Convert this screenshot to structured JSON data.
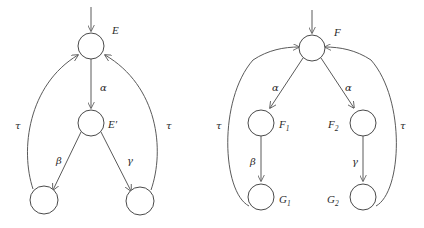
{
  "figure": {
    "background_color": "#ffffff",
    "stroke_color": "#5a5a5a",
    "text_color": "#2b2b2b"
  },
  "diagrams": [
    {
      "id": "left-diagram",
      "name": "E-diagram",
      "nodes": [
        {
          "id": "E",
          "label": "E",
          "label_suffix": "",
          "cx": 91,
          "cy": 46,
          "r": 13,
          "label_x": 112,
          "label_y": 34
        },
        {
          "id": "Eprime",
          "label": "E",
          "label_suffix": "′",
          "cx": 91,
          "cy": 123,
          "r": 13,
          "label_x": 110,
          "label_y": 128
        },
        {
          "id": "Lbot",
          "label": "",
          "label_suffix": "",
          "cx": 44,
          "cy": 200,
          "r": 14,
          "label_x": 0,
          "label_y": 0
        },
        {
          "id": "Rbot",
          "label": "",
          "label_suffix": "",
          "cx": 140,
          "cy": 201,
          "r": 14,
          "label_x": 0,
          "label_y": 0
        }
      ],
      "edges": [
        {
          "id": "entry",
          "from": "",
          "to": "E",
          "label": "",
          "label_x": 0,
          "label_y": 0
        },
        {
          "id": "E-to-Ep",
          "from": "E",
          "to": "Eprime",
          "label": "α",
          "label_x": 100,
          "label_y": 91
        },
        {
          "id": "Ep-to-Lbot",
          "from": "Eprime",
          "to": "Lbot",
          "label": "β",
          "label_x": 56,
          "label_y": 164
        },
        {
          "id": "Ep-to-Rbot",
          "from": "Eprime",
          "to": "Rbot",
          "label": "γ",
          "label_x": 127,
          "label_y": 164
        },
        {
          "id": "Lbot-to-E",
          "from": "Lbot",
          "to": "E",
          "label": "τ",
          "label_x": 15,
          "label_y": 129
        },
        {
          "id": "Rbot-to-E",
          "from": "Rbot",
          "to": "E",
          "label": "τ",
          "label_x": 168,
          "label_y": 129
        }
      ]
    },
    {
      "id": "right-diagram",
      "name": "F-diagram",
      "nodes": [
        {
          "id": "F",
          "label": "F",
          "label_suffix": "",
          "cx": 312,
          "cy": 48,
          "r": 13,
          "label_x": 334,
          "label_y": 36
        },
        {
          "id": "F1",
          "label": "F",
          "label_suffix": "1",
          "cx": 261,
          "cy": 123,
          "r": 13,
          "label_x": 281,
          "label_y": 128
        },
        {
          "id": "F2",
          "label": "F",
          "label_suffix": "2",
          "cx": 363,
          "cy": 123,
          "r": 13,
          "label_x": 330,
          "label_y": 128
        },
        {
          "id": "G1",
          "label": "G",
          "label_suffix": "1",
          "cx": 261,
          "cy": 197,
          "r": 13,
          "label_x": 281,
          "label_y": 203
        },
        {
          "id": "G2",
          "label": "G",
          "label_suffix": "2",
          "cx": 363,
          "cy": 197,
          "r": 13,
          "label_x": 329,
          "label_y": 203
        }
      ],
      "edges": [
        {
          "id": "entry",
          "from": "",
          "to": "F",
          "label": "",
          "label_x": 0,
          "label_y": 0
        },
        {
          "id": "F-to-F1",
          "from": "F",
          "to": "F1",
          "label": "α",
          "label_x": 275,
          "label_y": 91
        },
        {
          "id": "F-to-F2",
          "from": "F",
          "to": "F2",
          "label": "α",
          "label_x": 347,
          "label_y": 91
        },
        {
          "id": "F1-to-G1",
          "from": "F1",
          "to": "G1",
          "label": "β",
          "label_x": 252,
          "label_y": 165
        },
        {
          "id": "F2-to-G2",
          "from": "F2",
          "to": "G2",
          "label": "γ",
          "label_x": 354,
          "label_y": 165
        },
        {
          "id": "G1-to-F",
          "from": "G1",
          "to": "F",
          "label": "τ",
          "label_x": 218,
          "label_y": 129
        },
        {
          "id": "G2-to-F",
          "from": "G2",
          "to": "F",
          "label": "τ",
          "label_x": 403,
          "label_y": 129
        }
      ]
    }
  ]
}
